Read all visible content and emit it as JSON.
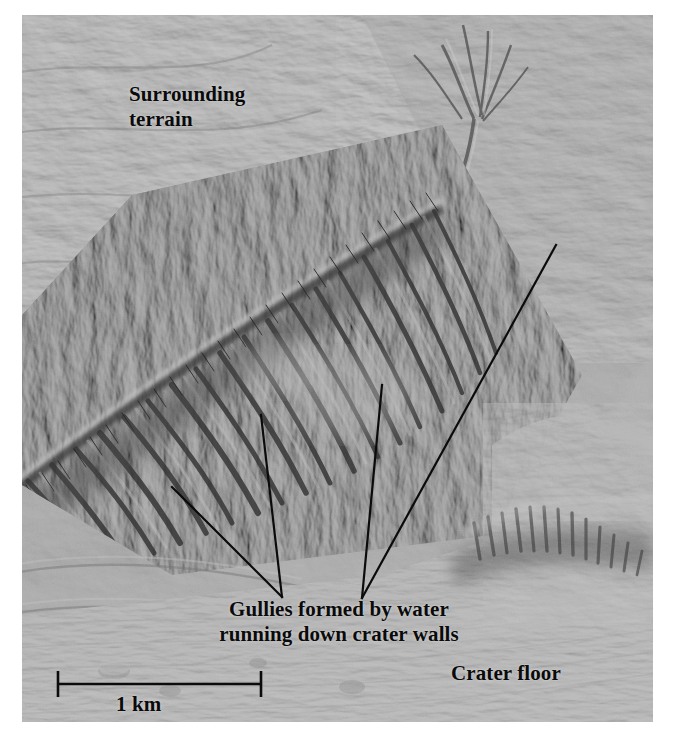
{
  "figure": {
    "kind": "annotated-satellite-photo",
    "background_color": "#8d8d8d",
    "annotation_color": "#0a0a0a",
    "plate": {
      "x": 22,
      "y": 15,
      "width": 631,
      "height": 707
    }
  },
  "labels": {
    "surrounding_terrain": "Surrounding\nterrain",
    "gullies": "Gullies formed by water\nrunning down crater walls",
    "crater_floor": "Crater floor"
  },
  "scale_bar": {
    "label": "1 km",
    "x1": 57,
    "x2": 262,
    "y": 684,
    "cap_height": 26
  },
  "leader_lines": [
    {
      "name": "gully-leader-left-diagonal",
      "x1": 172,
      "y1": 487,
      "x2": 282,
      "y2": 597
    },
    {
      "name": "gully-leader-left-vertical",
      "x1": 261,
      "y1": 415,
      "x2": 282,
      "y2": 597
    },
    {
      "name": "gully-leader-right-vertical",
      "x1": 382,
      "y1": 385,
      "x2": 362,
      "y2": 598
    },
    {
      "name": "gully-leader-right-long-diagonal",
      "x1": 556,
      "y1": 245,
      "x2": 362,
      "y2": 598
    }
  ]
}
